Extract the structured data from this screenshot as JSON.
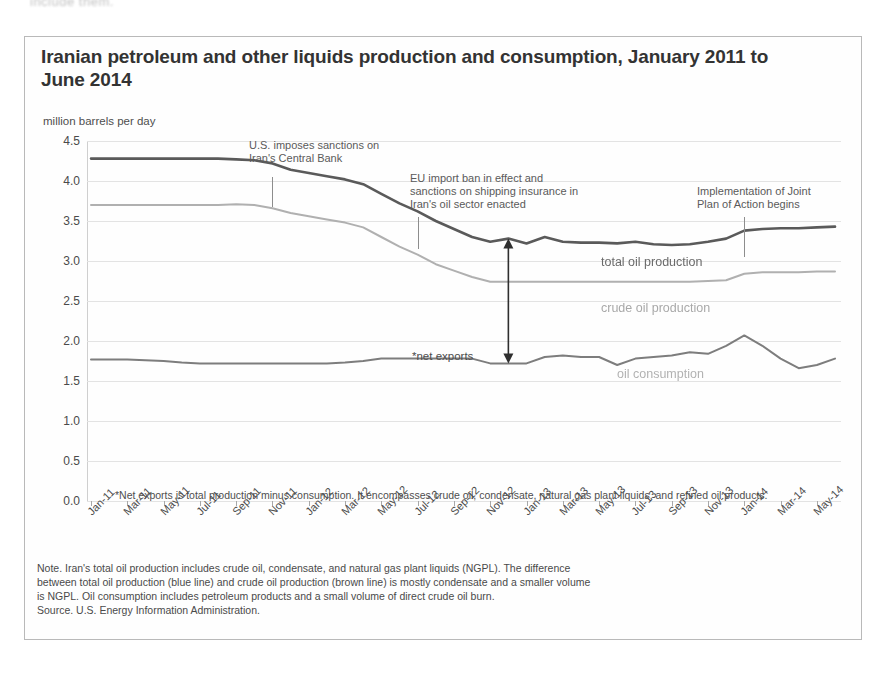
{
  "scan_artifact": "include them.",
  "chart": {
    "title": "Iranian petroleum and other liquids production and consumption, January 2011 to June 2014",
    "y_axis_unit": "million barrels per day",
    "footnote": "*Net exports is total production minus consumption. It encompasses crude oil, condensate, natural gas plant liquids, and refined oil products.",
    "note_lines": [
      "Note. Iran's total oil production includes crude oil, condensate, and natural gas plant liquids (NGPL). The difference",
      "between total oil production (blue line) and crude oil  production (brown line) is mostly condensate and a smaller volume",
      "is NGPL. Oil consumption includes petroleum products and a small volume of direct crude oil burn."
    ],
    "source": "Source. U.S. Energy Information Administration.",
    "annotations": [
      {
        "id": "us-sanctions",
        "text": "U.S. imposes sanctions on\nIran's Central Bank",
        "x_index": 10,
        "left_px": 224,
        "top_px": 102,
        "leader_top_px": 140,
        "leader_height_px": 30
      },
      {
        "id": "eu-import-ban",
        "text": "EU import ban in effect and\nsanctions on shipping insurance in\nIran's oil sector enacted",
        "x_index": 18,
        "left_px": 385,
        "top_px": 135,
        "leader_top_px": 180,
        "leader_height_px": 32
      },
      {
        "id": "joint-plan-of-action",
        "text": "Implementation of Joint\nPlan of Action begins",
        "x_index": 36,
        "left_px": 672,
        "top_px": 148,
        "leader_top_px": 180,
        "leader_height_px": 40
      }
    ],
    "series_labels": {
      "total": "total oil production",
      "crude": "crude oil production",
      "consumption": "oil consumption",
      "net_exports": "*net exports"
    },
    "colors": {
      "total_oil_production": "#5a5a5a",
      "crude_oil_production": "#b0b0b0",
      "oil_consumption": "#7d7d7d",
      "gridline": "#e3e3e3",
      "axis": "#9a9a9a",
      "frame": "#b9b9b9",
      "annotation_text": "#5a5a5a"
    }
  },
  "chart_data": {
    "type": "line",
    "title": "Iranian petroleum and other liquids production and consumption, January 2011 to June 2014",
    "xlabel": "",
    "ylabel": "million barrels per day",
    "ylim": [
      0.0,
      4.5
    ],
    "yticks": [
      "0.0",
      "0.5",
      "1.0",
      "1.5",
      "2.0",
      "2.5",
      "3.0",
      "3.5",
      "4.0",
      "4.5"
    ],
    "grid": true,
    "legend": "inline-series-labels",
    "x": [
      "Jan-11",
      "Feb-11",
      "Mar-11",
      "Apr-11",
      "May-11",
      "Jun-11",
      "Jul-11",
      "Aug-11",
      "Sep-11",
      "Oct-11",
      "Nov-11",
      "Dec-11",
      "Jan-12",
      "Feb-12",
      "Mar-12",
      "Apr-12",
      "May-12",
      "Jun-12",
      "Jul-12",
      "Aug-12",
      "Sep-12",
      "Oct-12",
      "Nov-12",
      "Dec-12",
      "Jan-13",
      "Feb-13",
      "Mar-13",
      "Apr-13",
      "May-13",
      "Jun-13",
      "Jul-13",
      "Aug-13",
      "Sep-13",
      "Oct-13",
      "Nov-13",
      "Dec-13",
      "Jan-14",
      "Feb-14",
      "Mar-14",
      "Apr-14",
      "May-14",
      "Jun-14"
    ],
    "xtick_labels": [
      "Jan-11",
      "Mar-11",
      "May-11",
      "Jul-11",
      "Sep-11",
      "Nov-11",
      "Jan-12",
      "Mar-12",
      "May-12",
      "Jul-12",
      "Sep-12",
      "Nov-12",
      "Jan-13",
      "Mar-13",
      "May-13",
      "Jul-13",
      "Sep-13",
      "Nov-13",
      "Jan-14",
      "Mar-14",
      "May-14"
    ],
    "series": [
      {
        "name": "total oil production",
        "color": "#5a5a5a",
        "values": [
          4.28,
          4.28,
          4.28,
          4.28,
          4.28,
          4.28,
          4.28,
          4.28,
          4.27,
          4.26,
          4.22,
          4.14,
          4.1,
          4.06,
          4.02,
          3.96,
          3.84,
          3.72,
          3.62,
          3.5,
          3.4,
          3.3,
          3.24,
          3.28,
          3.22,
          3.3,
          3.24,
          3.23,
          3.23,
          3.22,
          3.24,
          3.21,
          3.2,
          3.21,
          3.24,
          3.28,
          3.38,
          3.4,
          3.41,
          3.41,
          3.42,
          3.43
        ]
      },
      {
        "name": "crude oil production",
        "color": "#b0b0b0",
        "values": [
          3.7,
          3.7,
          3.7,
          3.7,
          3.7,
          3.7,
          3.7,
          3.7,
          3.71,
          3.7,
          3.66,
          3.6,
          3.56,
          3.52,
          3.48,
          3.42,
          3.3,
          3.18,
          3.08,
          2.96,
          2.88,
          2.8,
          2.74,
          2.74,
          2.74,
          2.74,
          2.74,
          2.74,
          2.74,
          2.74,
          2.74,
          2.74,
          2.74,
          2.74,
          2.75,
          2.76,
          2.84,
          2.86,
          2.86,
          2.86,
          2.87,
          2.87
        ]
      },
      {
        "name": "oil consumption",
        "color": "#7d7d7d",
        "values": [
          1.77,
          1.77,
          1.77,
          1.76,
          1.75,
          1.73,
          1.72,
          1.72,
          1.72,
          1.72,
          1.72,
          1.72,
          1.72,
          1.72,
          1.73,
          1.75,
          1.78,
          1.78,
          1.78,
          1.78,
          1.78,
          1.78,
          1.72,
          1.72,
          1.72,
          1.8,
          1.82,
          1.8,
          1.8,
          1.7,
          1.78,
          1.8,
          1.82,
          1.86,
          1.84,
          1.94,
          2.07,
          1.94,
          1.78,
          1.66,
          1.7,
          1.78
        ]
      }
    ],
    "annotation_markers": [
      {
        "label": "U.S. imposes sanctions on Iran's Central Bank",
        "at_x": "Nov-11"
      },
      {
        "label": "EU import ban in effect and sanctions on shipping insurance in Iran's oil sector enacted",
        "at_x": "Jul-12"
      },
      {
        "label": "Implementation of Joint Plan of Action begins",
        "at_x": "Jan-14"
      }
    ],
    "net_exports_arrow": {
      "label": "*net exports",
      "at_x": "Dec-12",
      "from": 1.72,
      "to": 3.28
    }
  }
}
